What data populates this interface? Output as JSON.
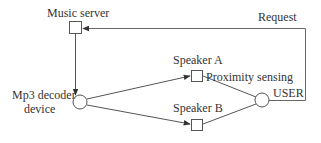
{
  "diagram": {
    "nodes": {
      "music_server": {
        "label": "Music server",
        "shape": "square"
      },
      "mp3_decoder": {
        "label_line1": "Mp3 decoder",
        "label_line2": "device",
        "shape": "circle"
      },
      "speaker_a": {
        "label": "Speaker A",
        "shape": "square"
      },
      "speaker_b": {
        "label": "Speaker B",
        "shape": "square"
      },
      "user": {
        "label": "USER",
        "shape": "circle"
      }
    },
    "edges": {
      "request": {
        "label": "Request",
        "from": "USER",
        "to": "Music server"
      },
      "proximity": {
        "label": "Proximity sensing",
        "from": "USER",
        "to": "Speaker A"
      },
      "server_to_decoder": {
        "from": "Music server",
        "to": "Mp3 decoder device"
      },
      "decoder_to_a": {
        "from": "Mp3 decoder device",
        "to": "Speaker A"
      },
      "decoder_to_b": {
        "from": "Mp3 decoder device",
        "to": "Speaker B"
      },
      "user_to_b": {
        "from": "USER",
        "to": "Speaker B"
      }
    },
    "colors": {
      "stroke": "#555555",
      "text": "#333333"
    }
  }
}
